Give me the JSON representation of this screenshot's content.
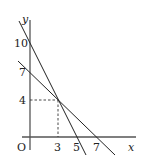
{
  "diagram": {
    "axis_labels": {
      "x": "x",
      "y": "y",
      "origin": "O"
    },
    "y_ticks": [
      "10",
      "7",
      "4"
    ],
    "x_ticks": [
      "3",
      "5",
      "7"
    ],
    "lines": [
      {
        "name": "line-a",
        "y_intercept": 10,
        "x_intercept": 5,
        "equation": "2x + y = 10"
      },
      {
        "name": "line-b",
        "y_intercept": 7,
        "x_intercept": 7,
        "equation": "x + y = 7"
      }
    ],
    "intersection": {
      "x": 3,
      "y": 4,
      "label": "(3, 4)"
    }
  }
}
